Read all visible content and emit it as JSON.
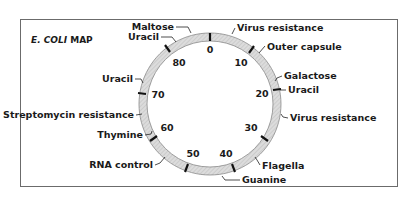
{
  "title": {
    "italic": "E. COLI",
    "rest": " MAP"
  },
  "ring": {
    "cx": 210,
    "cy": 104,
    "outer": 71,
    "inner": 63,
    "fill": "#d9d9d9",
    "stroke": "#7a7a7a"
  },
  "ticks": [
    {
      "label": "0",
      "x": 210,
      "y": 36,
      "tx": 210,
      "ty": 55
    },
    {
      "label": "10",
      "x": 251,
      "y": 50,
      "tx": 241,
      "ty": 65
    },
    {
      "label": "20",
      "x": 279,
      "y": 89,
      "tx": 262,
      "ty": 94
    },
    {
      "label": "30",
      "x": 264,
      "y": 138,
      "tx": 252,
      "ty": 131
    },
    {
      "label": "40",
      "x": 233,
      "y": 168,
      "tx": 226,
      "ty": 156
    },
    {
      "label": "50",
      "x": 187,
      "y": 168,
      "tx": 194,
      "ty": 156
    },
    {
      "label": "60",
      "x": 154,
      "y": 138,
      "tx": 166,
      "ty": 131
    },
    {
      "label": "70",
      "x": 141,
      "y": 94,
      "tx": 158,
      "ty": 97
    },
    {
      "label": "80",
      "x": 168,
      "y": 49,
      "tx": 178,
      "ty": 65
    }
  ],
  "genes": [
    {
      "label": "Maltose",
      "anchor": "end",
      "tx": 174,
      "ty": 30
    },
    {
      "label": "Uracil",
      "anchor": "end",
      "tx": 159,
      "ty": 40
    },
    {
      "label": "Uracil",
      "anchor": "end",
      "tx": 133,
      "ty": 82
    },
    {
      "label": "Streptomycin resistance",
      "anchor": "end",
      "tx": 134,
      "ty": 118
    },
    {
      "label": "Thymine",
      "anchor": "end",
      "tx": 143,
      "ty": 138
    },
    {
      "label": "RNA control",
      "anchor": "end",
      "tx": 153,
      "ty": 168
    },
    {
      "label": "Virus resistance",
      "anchor": "start",
      "tx": 237,
      "ty": 31
    },
    {
      "label": "Outer capsule",
      "anchor": "start",
      "tx": 267,
      "ty": 50
    },
    {
      "label": "Galactose",
      "anchor": "start",
      "tx": 284,
      "ty": 79
    },
    {
      "label": "Uracil",
      "anchor": "start",
      "tx": 288,
      "ty": 93
    },
    {
      "label": "Virus resistance",
      "anchor": "start",
      "tx": 290,
      "ty": 121
    },
    {
      "label": "Flagella",
      "anchor": "start",
      "tx": 262,
      "ty": 169
    },
    {
      "label": "Guanine",
      "anchor": "start",
      "tx": 242,
      "ty": 183
    }
  ]
}
